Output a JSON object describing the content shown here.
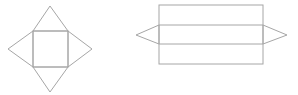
{
  "diagram": {
    "stroke_color": "#a6a6a6",
    "stroke_width": 1,
    "figures": [
      {
        "name": "square-pyramid-net",
        "square": {
          "x": 33,
          "y": 31,
          "w": 35,
          "h": 36
        },
        "triangles": [
          {
            "points": "33,31 50,6 68,31"
          },
          {
            "points": "33,31 8,49 33,67"
          },
          {
            "points": "68,31 92,49 68,67"
          },
          {
            "points": "33,67 50,92 68,67"
          }
        ]
      },
      {
        "name": "triangular-prism-net",
        "rect": {
          "x": 159,
          "y": 5,
          "w": 104,
          "h": 59
        },
        "inner_lines_y": [
          25,
          44
        ],
        "triangles": [
          {
            "points": "159,25 136,35 159,44"
          },
          {
            "points": "263,25 287,35 263,44"
          }
        ]
      }
    ]
  }
}
